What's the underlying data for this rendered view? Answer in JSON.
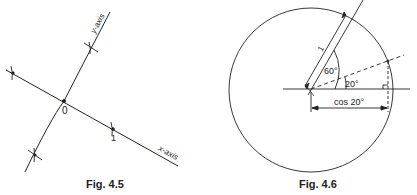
{
  "figures": [
    {
      "caption": "Fig. 4.5",
      "origin_label": "0",
      "unit_label": "1",
      "x_axis_label": "x-axis",
      "y_axis_label": "y-axis"
    },
    {
      "caption": "Fig. 4.6",
      "radius_label": "1",
      "angle_large_label": "60°",
      "angle_small_label": "20°",
      "dimension_label": "cos 20°"
    }
  ],
  "colors": {
    "line": "#222222",
    "background": "#ffffff"
  }
}
